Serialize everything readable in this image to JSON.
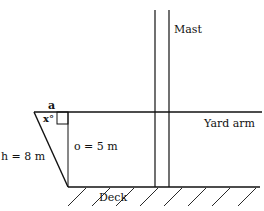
{
  "labels": {
    "mast": "Mast",
    "yard_arm": "Yard arm",
    "deck": "Deck",
    "alpha": "a",
    "angle": "x°",
    "opposite": "o = 5 m",
    "hypotenuse": "h = 8 m"
  },
  "colors": {
    "stroke": "#111111",
    "background": "#ffffff"
  }
}
